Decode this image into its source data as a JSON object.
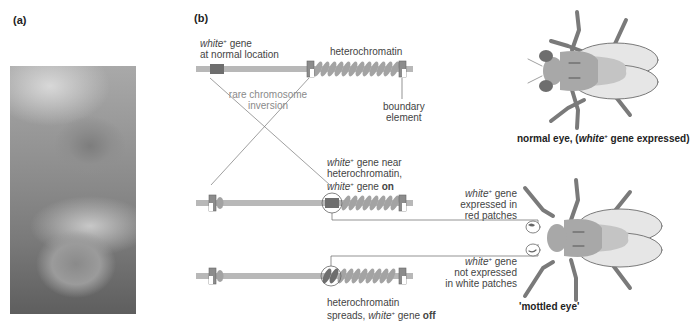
{
  "panel_a": {
    "label": "(a)",
    "photo_description": "close-up photograph of two fruit fly eyes"
  },
  "panel_b": {
    "label": "(b)",
    "top_chromosome": {
      "gene_label_italic": "white",
      "gene_label_sup": "+",
      "gene_label_rest": " gene",
      "gene_label_line2": "at normal location",
      "heterochromatin_label": "heterochromatin",
      "boundary_label_line1": "boundary",
      "boundary_label_line2": "element"
    },
    "inversion_label_line1": "rare chromosome",
    "inversion_label_line2": "inversion",
    "middle_chromosome": {
      "line1_italic": "white",
      "line1_sup": "+",
      "line1_rest": " gene near",
      "line2": "heterochromatin,",
      "line3_italic": "white",
      "line3_sup": "+",
      "line3_rest": " gene ",
      "line3_bold": "on"
    },
    "bottom_chromosome": {
      "line1": "heterochromatin",
      "line2_pre": "spreads, ",
      "line2_italic": "white",
      "line2_sup": "+",
      "line2_rest": " gene ",
      "line2_bold": "off"
    }
  },
  "flies": {
    "normal": {
      "caption_pre": "normal eye, (",
      "caption_italic": "white",
      "caption_sup": "+",
      "caption_post": " gene expressed)"
    },
    "mottled": {
      "caption": "'mottled eye'",
      "expressed_italic": "white",
      "expressed_sup": "+",
      "expressed_rest": " gene",
      "expressed_line2": "expressed in",
      "expressed_line3": "red patches",
      "not_expressed_italic": "white",
      "not_expressed_sup": "+",
      "not_expressed_rest": " gene",
      "not_expressed_line2": "not expressed",
      "not_expressed_line3": "in white patches"
    }
  },
  "colors": {
    "chromosome": "#b5b5b5",
    "gene": "#6e6e6e",
    "heterochromatin": "#a3a3a3",
    "boundary": "#8c8c8c",
    "fly_leg": "#7a7a7a",
    "fly_body": "#a8a8a8",
    "wing": "#e3e3e3"
  }
}
